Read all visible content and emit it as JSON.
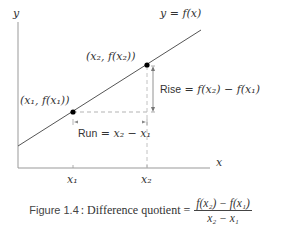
{
  "diagram": {
    "axes": {
      "y_label": "y",
      "x_label": "x",
      "color": "#999999"
    },
    "curve": {
      "label": "y = f(x)",
      "color": "#555555"
    },
    "points": [
      {
        "label": "(x₁, f(x₁))",
        "tick_label": "x₁"
      },
      {
        "label": "(x₂, f(x₂))",
        "tick_label": "x₂"
      }
    ],
    "rise": {
      "label": "Rise = f(x₂) − f(x₁)",
      "word": "Rise",
      "expr": " = f(x₂) − f(x₁)"
    },
    "run": {
      "label": "Run = x₂ − x₁",
      "word": "Run",
      "expr": " = x₂ − x₁"
    },
    "dashed_color": "#aaaaaa",
    "point_color": "#000000"
  },
  "caption": {
    "figure_label": "Figure 1.4",
    "text": ": Difference quotient =",
    "numerator": "f(x₂) − f(x₁)",
    "denominator": "x₂ − x₁"
  }
}
